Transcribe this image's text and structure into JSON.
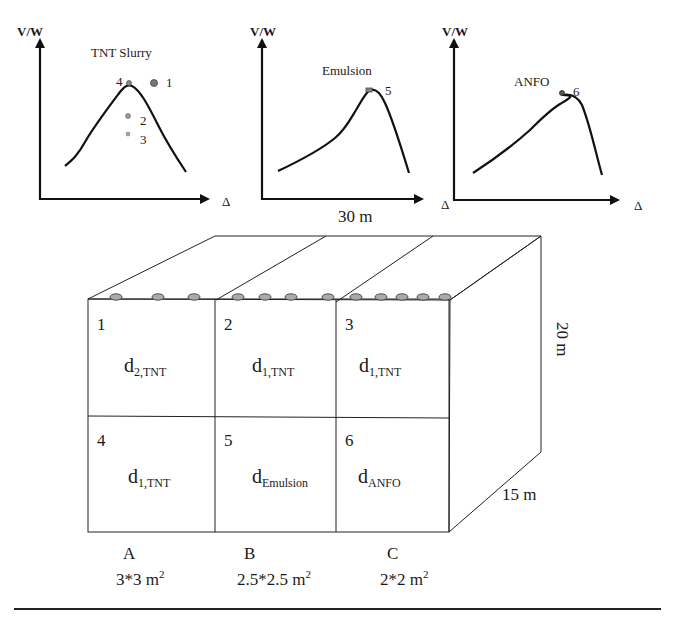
{
  "graphs": [
    {
      "id": "tnt-slurry",
      "y_axis_label": "V/W",
      "x_axis_label": "Δ",
      "curve_label": "TNT Slurry",
      "points": [
        {
          "label": "4"
        },
        {
          "label": "1"
        },
        {
          "label": "2"
        },
        {
          "label": "3"
        }
      ]
    },
    {
      "id": "emulsion",
      "y_axis_label": "V/W",
      "x_axis_label": "Δ",
      "curve_label": "Emulsion",
      "points": [
        {
          "label": "5"
        }
      ]
    },
    {
      "id": "anfo",
      "y_axis_label": "V/W",
      "x_axis_label": "Δ",
      "curve_label": "ANFO",
      "extra_label": "Δ",
      "points": [
        {
          "label": "6"
        }
      ]
    }
  ],
  "block": {
    "length_label": "30 m",
    "height_label": "20 m",
    "depth_label": "15 m",
    "cells": [
      {
        "number": "1",
        "d": "d",
        "sub": "2,TNT"
      },
      {
        "number": "2",
        "d": "d",
        "sub": "1,TNT"
      },
      {
        "number": "3",
        "d": "d",
        "sub": "1,TNT"
      },
      {
        "number": "4",
        "d": "d",
        "sub": "1,TNT"
      },
      {
        "number": "5",
        "d": "d",
        "sub": "Emulsion"
      },
      {
        "number": "6",
        "d": "d",
        "sub": "ANFO"
      }
    ],
    "columns": [
      {
        "letter": "A",
        "spacing": "3*3 m",
        "sup": "2",
        "holes": 3
      },
      {
        "letter": "B",
        "spacing": "2.5*2.5 m",
        "sup": "2",
        "holes": 4
      },
      {
        "letter": "C",
        "spacing": "2*2 m",
        "sup": "2",
        "holes": 5
      }
    ]
  }
}
